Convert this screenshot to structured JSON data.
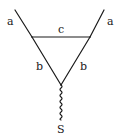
{
  "diagram": {
    "type": "feynman-triangle-vertex",
    "stroke_color": "#1a1a1a",
    "background": "#ffffff",
    "labels": {
      "left_external": "a",
      "right_external": "a",
      "top_internal": "c",
      "left_internal": "b",
      "right_internal": "b",
      "scalar": "S"
    },
    "lines": {
      "left_external": {
        "style": "solid",
        "from": [
          15,
          10
        ],
        "to": [
          32,
          37
        ]
      },
      "right_external": {
        "style": "solid",
        "from": [
          104,
          10
        ],
        "to": [
          90,
          37
        ]
      },
      "top_internal": {
        "style": "solid",
        "from": [
          32,
          37
        ],
        "to": [
          90,
          37
        ]
      },
      "left_internal": {
        "style": "solid",
        "from": [
          32,
          37
        ],
        "to": [
          61,
          85
        ]
      },
      "right_internal": {
        "style": "solid",
        "from": [
          90,
          37
        ],
        "to": [
          61,
          85
        ]
      },
      "scalar": {
        "style": "wavy",
        "from": [
          61,
          85
        ],
        "to": [
          61,
          120
        ]
      }
    }
  }
}
